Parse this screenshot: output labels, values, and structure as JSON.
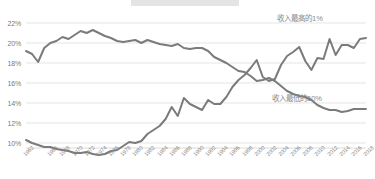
{
  "chart_data": {
    "type": "line",
    "title": "",
    "subtitle": "",
    "xlabel": "",
    "ylabel": "",
    "ylim": [
      9,
      23
    ],
    "yticks": [
      "10%",
      "12%",
      "14%",
      "16%",
      "18%",
      "20%",
      "22%"
    ],
    "ytick_values": [
      10,
      12,
      14,
      16,
      18,
      20,
      22
    ],
    "grid": true,
    "legend_position": "inline-right",
    "x": [
      1962,
      1963,
      1964,
      1965,
      1966,
      1967,
      1968,
      1969,
      1970,
      1971,
      1972,
      1973,
      1974,
      1975,
      1976,
      1977,
      1978,
      1979,
      1980,
      1981,
      1982,
      1983,
      1984,
      1985,
      1986,
      1987,
      1988,
      1989,
      1990,
      1991,
      1992,
      1993,
      1994,
      1995,
      1996,
      1997,
      1998,
      1999,
      2000,
      2001,
      2002,
      2003,
      2004,
      2005,
      2006,
      2007,
      2008,
      2009,
      2010,
      2011,
      2012,
      2013,
      2014,
      2015,
      2016,
      2017,
      2018
    ],
    "xticks": [
      "1962",
      "1966",
      "1968",
      "1970",
      "1972",
      "1974",
      "1976",
      "1978",
      "1980",
      "1982",
      "1984",
      "1986",
      "1988",
      "1990",
      "1992",
      "1994",
      "1996",
      "1998",
      "2000",
      "2002",
      "2004",
      "2006",
      "2008",
      "2010",
      "2012",
      "2014",
      "2016",
      "2018"
    ],
    "series": [
      {
        "name": "收入最高的1%",
        "color": "#7b7b7b",
        "label_x": 2003,
        "label_y": 21.6,
        "values": [
          10.3,
          10.0,
          9.8,
          9.6,
          9.6,
          9.4,
          9.3,
          9.2,
          9.0,
          9.0,
          9.1,
          8.9,
          8.8,
          8.9,
          9.2,
          9.3,
          9.7,
          10.1,
          10.0,
          10.2,
          10.9,
          11.3,
          11.7,
          12.4,
          13.6,
          12.7,
          14.5,
          13.9,
          13.6,
          13.3,
          14.3,
          13.9,
          13.9,
          14.6,
          15.6,
          16.3,
          16.8,
          17.5,
          18.3,
          16.6,
          16.2,
          16.4,
          17.8,
          18.7,
          19.1,
          19.6,
          18.2,
          17.3,
          18.5,
          18.4,
          20.4,
          18.8,
          19.8,
          19.8,
          19.5,
          20.4,
          20.5
        ]
      },
      {
        "name": "收入最低的50%",
        "color": "#7b7b7b",
        "label_x": 2004,
        "label_y": 13.8,
        "values": [
          19.2,
          18.9,
          18.1,
          19.5,
          20.0,
          20.2,
          20.6,
          20.4,
          20.8,
          21.2,
          21.0,
          21.3,
          21.0,
          20.7,
          20.5,
          20.2,
          20.1,
          20.2,
          20.3,
          20.0,
          20.3,
          20.1,
          19.9,
          19.8,
          19.7,
          19.9,
          19.5,
          19.4,
          19.5,
          19.5,
          19.2,
          18.6,
          18.3,
          18.0,
          17.6,
          17.2,
          17.1,
          16.7,
          16.2,
          16.3,
          16.5,
          16.2,
          15.7,
          15.2,
          14.9,
          14.7,
          14.6,
          14.3,
          13.8,
          13.5,
          13.3,
          13.3,
          13.1,
          13.2,
          13.4,
          13.4,
          13.4
        ]
      }
    ]
  },
  "legend": {
    "top1": "收入最高的1%",
    "bottom50": "收入最低的50%"
  }
}
